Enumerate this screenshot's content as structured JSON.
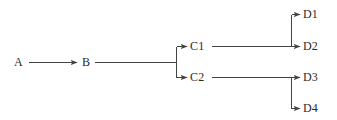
{
  "diagram": {
    "type": "tree-flow-diagram",
    "background_color": "#ffffff",
    "stroke_color": "#434343",
    "text_color": "#2b2b2b",
    "stroke_width": 1,
    "width": 337,
    "height": 120,
    "nodes": [
      {
        "id": "A",
        "label": "A",
        "x": 14,
        "y": 61,
        "level": 0
      },
      {
        "id": "B",
        "label": "B",
        "x": 82,
        "y": 61,
        "level": 1
      },
      {
        "id": "C1",
        "label": "C1",
        "x": 190,
        "y": 40,
        "level": 2
      },
      {
        "id": "C2",
        "label": "C2",
        "x": 190,
        "y": 71,
        "level": 2
      },
      {
        "id": "D1",
        "label": "D1",
        "x": 303,
        "y": 8,
        "level": 3
      },
      {
        "id": "D2",
        "label": "D2",
        "x": 303,
        "y": 40,
        "level": 3
      },
      {
        "id": "D3",
        "label": "D3",
        "x": 303,
        "y": 71,
        "level": 3
      },
      {
        "id": "D4",
        "label": "D4",
        "x": 303,
        "y": 102,
        "level": 3
      }
    ],
    "edges": [
      {
        "id": "edge-a-b",
        "from": "A",
        "to": "B",
        "style": "straight-arrow"
      },
      {
        "id": "edge-b-c1",
        "from": "B",
        "to": "C1",
        "style": "elbow-arrow"
      },
      {
        "id": "edge-b-c2",
        "from": "B",
        "to": "C2",
        "style": "elbow-arrow"
      },
      {
        "id": "edge-c1-d1",
        "from": "C1",
        "to": "D1",
        "style": "elbow-arrow"
      },
      {
        "id": "edge-c1-d2",
        "from": "C1",
        "to": "D2",
        "style": "straight-arrow"
      },
      {
        "id": "edge-c2-d3",
        "from": "C2",
        "to": "D3",
        "style": "straight-arrow"
      },
      {
        "id": "edge-c2-d4",
        "from": "C2",
        "to": "D4",
        "style": "elbow-arrow"
      }
    ]
  }
}
